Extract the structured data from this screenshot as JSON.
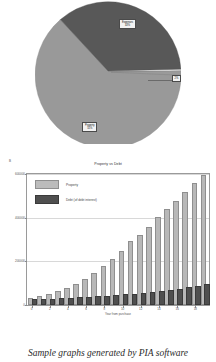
{
  "caption": "Sample graphs generated by PIA software",
  "pie_chart": {
    "type": "pie",
    "title": "",
    "legend_position": "none",
    "labels": [
      "Property\n55%",
      "Expenses\n43%",
      "Cash\n2%"
    ],
    "categories": [
      "Property",
      "Expenses",
      "Cash"
    ],
    "values": [
      55,
      43,
      2
    ],
    "colors": [
      "#999999",
      "#585858",
      "#9a9a9a"
    ],
    "slice_label_light": "Property\n55%",
    "slice_label_dark": "Expenses\n43%",
    "slice_label_sliver": "2%"
  },
  "bar_chart": {
    "type": "bar",
    "title": "Property vs Debt",
    "corner_mark": "B",
    "xlabel": "Year from purchase",
    "ylabel": "",
    "ylim": [
      0,
      600000
    ],
    "yticks": [
      0,
      200000,
      400000,
      600000
    ],
    "ytick_labels": [
      "0",
      "200000",
      "400000",
      "600000"
    ],
    "xticks": [
      0,
      2,
      4,
      6,
      8,
      10,
      12,
      14,
      16,
      18
    ],
    "xtick_labels": [
      "0",
      "2",
      "4",
      "6",
      "8",
      "10",
      "12",
      "14",
      "16",
      "18"
    ],
    "grid": true,
    "legend_position": "upper left",
    "legend": [
      {
        "label": "Property",
        "color": "#bcbcbc"
      },
      {
        "label": "Debt (of debt interest)",
        "color": "#4f4f4f"
      }
    ],
    "categories": [
      0,
      1,
      2,
      3,
      4,
      5,
      6,
      7,
      8,
      9,
      10,
      11,
      12,
      13,
      14,
      15,
      16,
      17,
      18,
      19
    ],
    "series": [
      {
        "name": "Property",
        "color": "#bcbcbc",
        "values": [
          21000,
          30000,
          41000,
          54000,
          70000,
          89000,
          112000,
          138000,
          168000,
          202000,
          240000,
          283000,
          310000,
          348000,
          392000,
          430000,
          466000,
          508000,
          548000,
          585000
        ]
      },
      {
        "name": "Debt (of debt interest)",
        "color": "#4f4f4f",
        "values": [
          18000,
          19000,
          20500,
          22000,
          24000,
          26000,
          28500,
          31000,
          34000,
          37000,
          40000,
          43500,
          47000,
          51000,
          55500,
          60500,
          66000,
          72000,
          79000,
          86000
        ]
      }
    ]
  }
}
